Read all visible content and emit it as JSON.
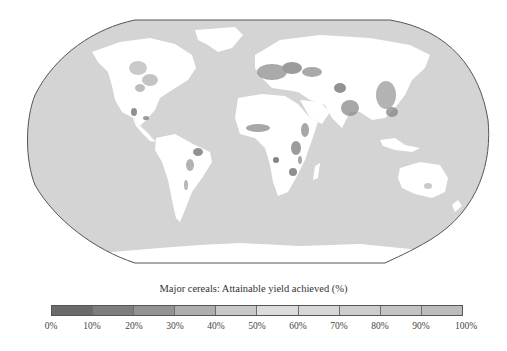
{
  "map": {
    "projection": "Robinson",
    "ocean_color": "#d4d4d4",
    "no_data_land_color": "#ffffff",
    "border_color": "#555555"
  },
  "legend": {
    "title": "Major cereals: Attainable yield achieved (%)",
    "ticks": [
      "0%",
      "10%",
      "20%",
      "30%",
      "40%",
      "50%",
      "60%",
      "70%",
      "80%",
      "90%",
      "100%"
    ],
    "bins": [
      {
        "range": "0-10%",
        "color": "#6a6a6a"
      },
      {
        "range": "10-20%",
        "color": "#7d7d7d"
      },
      {
        "range": "20-30%",
        "color": "#939393"
      },
      {
        "range": "30-40%",
        "color": "#aeaeae"
      },
      {
        "range": "40-50%",
        "color": "#c8c8c8"
      },
      {
        "range": "50-60%",
        "color": "#dcdcdc"
      },
      {
        "range": "60-70%",
        "color": "#d7d7d7"
      },
      {
        "range": "70-80%",
        "color": "#cdcdcd"
      },
      {
        "range": "80-90%",
        "color": "#c3c3c3"
      },
      {
        "range": "90-100%",
        "color": "#bcbcbc"
      }
    ]
  }
}
